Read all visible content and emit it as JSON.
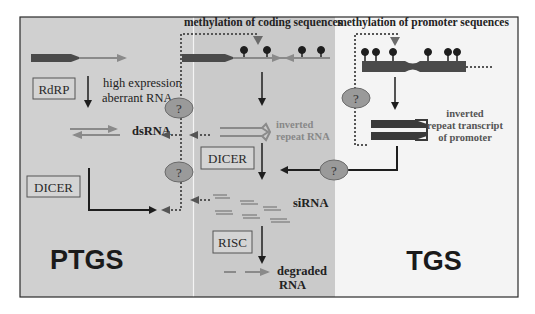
{
  "colors": {
    "ptgs_bg": "#cfcfcf",
    "mid_bg": "#cbcbcb",
    "tgs_bg": "#f4f4f4",
    "gene_dark": "#4a4a4a",
    "rna_gray": "#8a8a8a",
    "arrow_dark": "#1e1e1e",
    "question_fill": "#9a9a9a",
    "frame": "#2a2a2a"
  },
  "sections": {
    "ptgs": {
      "label": "PTGS"
    },
    "tgs": {
      "label": "TGS"
    }
  },
  "labels": {
    "methylation_coding": "methylation of coding sequences",
    "methylation_promoter": "methylation of promoter sequences",
    "high_expression_line1": "high expression",
    "high_expression_line2": "aberrant RNA",
    "dsrna": "dsRNA",
    "inverted_repeat_line1": "inverted",
    "inverted_repeat_line2": "repeat RNA",
    "promoter_transcript_line1": "inverted",
    "promoter_transcript_line2": "repeat transcript",
    "promoter_transcript_line3": "of promoter",
    "sirna": "siRNA",
    "degraded_line1": "degraded",
    "degraded_line2": "RNA"
  },
  "boxes": {
    "rdrp": "RdRP",
    "dicer_left": "DICER",
    "dicer_mid": "DICER",
    "risc": "RISC"
  },
  "question_marks": [
    {
      "id": "q1",
      "text": "?"
    },
    {
      "id": "q2",
      "text": "?"
    },
    {
      "id": "q3",
      "text": "?"
    },
    {
      "id": "q4",
      "text": "?"
    }
  ]
}
